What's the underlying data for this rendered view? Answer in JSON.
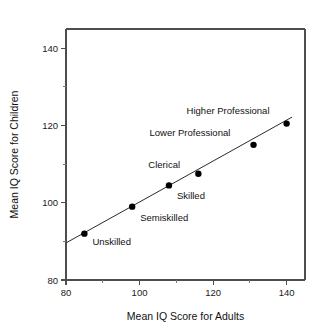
{
  "chart_data": {
    "type": "scatter",
    "title": "",
    "xlabel": "Mean IQ Score for Adults",
    "ylabel": "Mean IQ Score for Children",
    "xlim": [
      80,
      145
    ],
    "ylim": [
      80,
      145
    ],
    "xticks": [
      80,
      100,
      120,
      140
    ],
    "xticklabels": [
      "80",
      "100",
      "120",
      "140"
    ],
    "xminorticks": [
      90,
      110,
      130
    ],
    "yticks": [
      80,
      100,
      120,
      140
    ],
    "yticklabels": [
      "80",
      "100",
      "120",
      "140"
    ],
    "yminorticks": [
      90,
      110,
      130
    ],
    "grid": false,
    "legend": "none",
    "points": [
      {
        "label": "Unskilled",
        "x": 85,
        "y": 92,
        "label_dx": 8,
        "label_dy": 11
      },
      {
        "label": "Semiskilled",
        "x": 98,
        "y": 99,
        "label_dx": 8,
        "label_dy": 14
      },
      {
        "label": "Skilled",
        "x": 108,
        "y": 104.5,
        "label_dx": 8,
        "label_dy": 14
      },
      {
        "label": "Clerical",
        "x": 116,
        "y": 107.5,
        "label_dx": -50,
        "label_dy": -6
      },
      {
        "label": "Lower Professional",
        "x": 131,
        "y": 115,
        "label_dx": -104,
        "label_dy": -9
      },
      {
        "label": "Higher Professional",
        "x": 140,
        "y": 120.5,
        "label_dx": -100,
        "label_dy": -10
      }
    ],
    "series": [
      {
        "name": "Occupational class means",
        "x": [
          85,
          98,
          108,
          116,
          131,
          140
        ],
        "values": [
          92,
          99,
          104.5,
          107.5,
          115,
          120.5
        ]
      }
    ],
    "fit_line": {
      "name": "regression line",
      "x_start": 80,
      "y_start": 89.6,
      "x_end": 141.5,
      "y_end": 122.2
    },
    "colors": {
      "marker": "#000000",
      "line": "#2b2b2b",
      "axis": "#4d4d4d",
      "text": "#111111",
      "background": "#ffffff"
    }
  }
}
